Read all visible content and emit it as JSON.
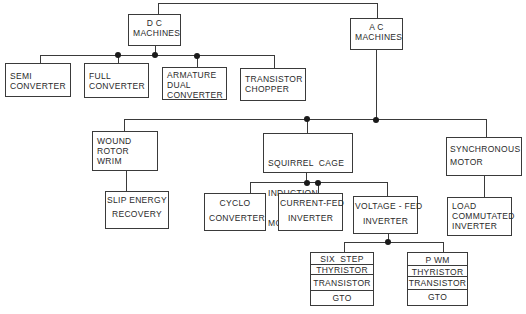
{
  "diagram": {
    "type": "tree",
    "root_children": [
      "dc_machines",
      "ac_machines"
    ],
    "dc_machines": {
      "lines": [
        "D C",
        "MACHINES"
      ],
      "children": [
        {
          "lines": [
            "SEMI",
            "CONVERTER"
          ]
        },
        {
          "lines": [
            "FULL",
            "CONVERTER"
          ]
        },
        {
          "lines": [
            "ARMATURE",
            "DUAL",
            "CONVERTER"
          ]
        },
        {
          "lines": [
            "TRANSISTOR",
            "CHOPPER"
          ]
        }
      ]
    },
    "ac_machines": {
      "lines": [
        "A C",
        "MACHINES"
      ],
      "children": [
        {
          "lines": [
            "WOUND",
            "ROTOR",
            "WRIM"
          ],
          "children": [
            {
              "lines": [
                "SLIP ENERGY",
                "RECOVERY"
              ]
            }
          ]
        },
        {
          "lines": [
            "SQUIRREL  CAGE",
            "INDUCTION",
            "MOTOR"
          ],
          "children": [
            {
              "lines": [
                "CYCLO",
                "CONVERTER"
              ]
            },
            {
              "lines": [
                "CURRENT-FED",
                "INVERTER"
              ]
            },
            {
              "lines": [
                "VOLTAGE - FED",
                "INVERTER"
              ],
              "children": [
                {
                  "cells": [
                    "SIX  STEP",
                    "THYRISTOR",
                    "TRANSISTOR",
                    "GTO"
                  ]
                },
                {
                  "cells": [
                    "P WM",
                    "THYRISTOR",
                    "TRANSISTOR",
                    "GTO"
                  ]
                }
              ]
            }
          ]
        },
        {
          "lines": [
            "SYNCHRONOUS",
            "MOTOR"
          ],
          "children": [
            {
              "lines": [
                "LOAD",
                "COMMUTATED",
                "INVERTER"
              ]
            }
          ]
        }
      ]
    }
  }
}
